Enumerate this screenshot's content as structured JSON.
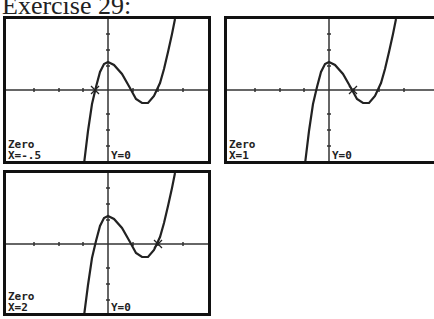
{
  "title": "Exercise 29:",
  "screens": [
    {
      "mode": "Zero",
      "x_label": "X=-.5",
      "y_label": "Y=0",
      "zero_x": -0.5
    },
    {
      "mode": "Zero",
      "x_label": "X=1",
      "y_label": "Y=0",
      "zero_x": 1
    },
    {
      "mode": "Zero",
      "x_label": "X=2",
      "y_label": "Y=0",
      "zero_x": 2
    }
  ],
  "function": "cubic with zeros at x=-0.5, 1, 2"
}
